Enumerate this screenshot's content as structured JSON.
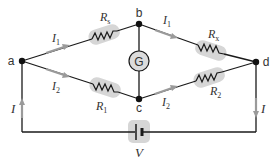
{
  "diagram": {
    "nodes": {
      "a": "a",
      "b": "b",
      "c": "c",
      "d": "d"
    },
    "resistors": {
      "Rs": {
        "main": "R",
        "sub": "s"
      },
      "Rx": {
        "main": "R",
        "sub": "x"
      },
      "R1": {
        "main": "R",
        "sub": "1"
      },
      "R2": {
        "main": "R",
        "sub": "2"
      }
    },
    "currents": {
      "I1_left": {
        "main": "I",
        "sub": "1"
      },
      "I1_right": {
        "main": "I",
        "sub": "1"
      },
      "I2_left": {
        "main": "I",
        "sub": "2"
      },
      "I2_right": {
        "main": "I",
        "sub": "2"
      },
      "I_left": "I",
      "I_right": "I"
    },
    "galvanometer": "G",
    "battery": "V",
    "colors": {
      "wire": "#1a1a1a",
      "arrow": "#9a9a9a",
      "highlight": "#d4d4d4",
      "galvanometer_fill": "#dcdcdc",
      "text": "#333333"
    }
  }
}
